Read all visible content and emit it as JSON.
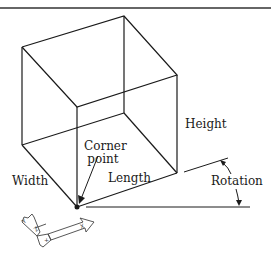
{
  "diagram": {
    "type": "isometric box with UCS icon",
    "labels": {
      "height": "Height",
      "corner_point_line1": "Corner",
      "corner_point_line2": "point",
      "width": "Width",
      "length": "Length",
      "rotation": "Rotation"
    },
    "ucs_icon": {
      "x_axis": "X",
      "y_axis": "Y",
      "z_axis": "Z",
      "plus_mark": "+"
    },
    "colors": {
      "line": "#1a1a1a",
      "background": "#ffffff",
      "rule": "#333333"
    }
  }
}
